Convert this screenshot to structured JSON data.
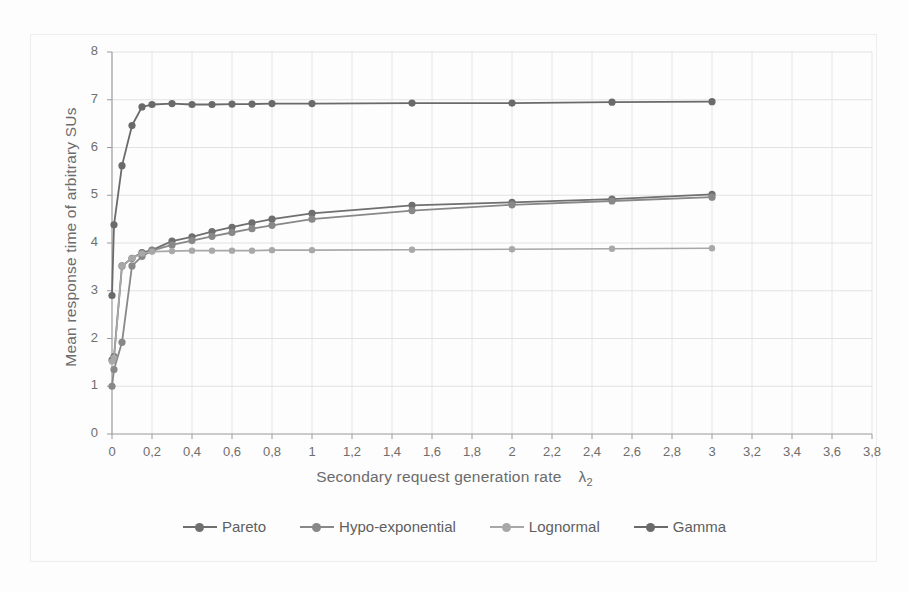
{
  "chart_data": {
    "type": "line",
    "title": "",
    "xlabel": "Secondary request generation rate λ2",
    "xlabel_text": "Secondary request generation rate",
    "xlabel_symbol": "λ",
    "xlabel_subscript": "2",
    "ylabel": "Mean response time of arbitrary SUs",
    "xlim": [
      0,
      3.8
    ],
    "ylim": [
      0,
      8
    ],
    "xticks": [
      0,
      0.2,
      0.4,
      0.6,
      0.8,
      1,
      1.2,
      1.4,
      1.6,
      1.8,
      2,
      2.2,
      2.4,
      2.6,
      2.8,
      3,
      3.2,
      3.4,
      3.6,
      3.8
    ],
    "xtick_labels": [
      "0",
      "0,2",
      "0,4",
      "0,6",
      "0,8",
      "1",
      "1,2",
      "1,4",
      "1,6",
      "1,8",
      "2",
      "2,2",
      "2,4",
      "2,6",
      "2,8",
      "3",
      "3,2",
      "3,4",
      "3,6",
      "3,8"
    ],
    "yticks": [
      0,
      1,
      2,
      3,
      4,
      5,
      6,
      7,
      8
    ],
    "ytick_labels": [
      "0",
      "1",
      "2",
      "3",
      "4",
      "5",
      "6",
      "7",
      "8"
    ],
    "grid": true,
    "grid_axis": "both",
    "legend_position": "bottom",
    "decimal_separator": ",",
    "x": [
      0,
      0.01,
      0.05,
      0.1,
      0.15,
      0.2,
      0.3,
      0.4,
      0.5,
      0.6,
      0.7,
      0.8,
      1.0,
      1.5,
      2.0,
      2.5,
      3.0
    ],
    "series": [
      {
        "name": "Pareto",
        "color": "#6f6f6f",
        "marker": "circle",
        "values": [
          1.55,
          1.62,
          3.52,
          3.68,
          3.8,
          3.85,
          4.04,
          4.13,
          4.24,
          4.33,
          4.42,
          4.5,
          4.62,
          4.79,
          4.85,
          4.92,
          5.02
        ]
      },
      {
        "name": "Hypo-exponential",
        "color": "#888888",
        "marker": "circle",
        "values": [
          1.0,
          1.35,
          1.92,
          3.52,
          3.72,
          3.84,
          3.96,
          4.05,
          4.14,
          4.22,
          4.3,
          4.37,
          4.5,
          4.68,
          4.8,
          4.88,
          4.96
        ]
      },
      {
        "name": "Lognormal",
        "color": "#a8a8a8",
        "marker": "circle",
        "values": [
          1.52,
          1.6,
          3.52,
          3.68,
          3.78,
          3.82,
          3.83,
          3.84,
          3.84,
          3.84,
          3.84,
          3.85,
          3.85,
          3.86,
          3.87,
          3.88,
          3.89
        ]
      },
      {
        "name": "Gamma",
        "color": "#6a6a6a",
        "marker": "circle",
        "values": [
          2.9,
          4.38,
          5.62,
          6.46,
          6.85,
          6.9,
          6.92,
          6.9,
          6.9,
          6.91,
          6.91,
          6.92,
          6.92,
          6.93,
          6.93,
          6.95,
          6.96
        ]
      }
    ]
  },
  "legend": {
    "items": [
      {
        "label": "Pareto",
        "color": "#6f6f6f"
      },
      {
        "label": "Hypo-exponential",
        "color": "#888888"
      },
      {
        "label": "Lognormal",
        "color": "#a8a8a8"
      },
      {
        "label": "Gamma",
        "color": "#6a6a6a"
      }
    ]
  }
}
